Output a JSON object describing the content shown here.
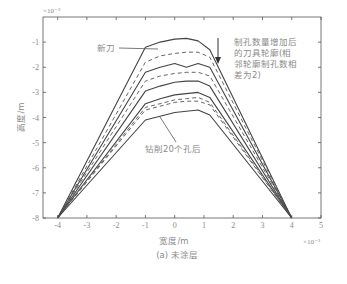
{
  "chart_data": {
    "type": "line",
    "title": "",
    "caption": "(a) 未涂层",
    "xlabel": "宽度/m",
    "ylabel": "高度/m",
    "x_exponent": "×10⁻³",
    "y_exponent": "×10⁻³",
    "xlim": [
      -4.5,
      5
    ],
    "ylim": [
      -8,
      0
    ],
    "xticks": [
      -4,
      -3,
      -2,
      -1,
      0,
      1,
      2,
      3,
      4,
      5
    ],
    "yticks": [
      -1,
      -2,
      -3,
      -4,
      -5,
      -6,
      -7,
      -8
    ],
    "xtick_labels": [
      "-4",
      "-3",
      "-2",
      "-1",
      "0",
      "1",
      "2",
      "3",
      "4",
      "5"
    ],
    "ytick_labels": [
      "-1",
      "-2",
      "-3",
      "-4",
      "-5",
      "-6",
      "-7",
      "-8"
    ],
    "grid": false,
    "annotations": {
      "new_tool": "新刀",
      "after_20": "钻削20个孔后",
      "arrow_note": [
        "制孔数量增加后",
        "的刀具轮廓(相",
        "邻轮廓制孔数相",
        "差为2)"
      ]
    },
    "series": [
      {
        "name": "新刀",
        "style": "solid",
        "x": [
          -4,
          -1.0,
          -0.5,
          0,
          0.4,
          0.8,
          1.2,
          4
        ],
        "y": [
          -8,
          -1.2,
          -1.0,
          -0.88,
          -0.85,
          -0.95,
          -1.3,
          -8
        ]
      },
      {
        "name": "2孔",
        "style": "dashed",
        "x": [
          -4,
          -1.0,
          -0.5,
          0,
          0.4,
          0.8,
          1.2,
          4
        ],
        "y": [
          -8,
          -1.8,
          -1.55,
          -1.45,
          -1.4,
          -1.4,
          -1.6,
          -8
        ]
      },
      {
        "name": "4孔",
        "style": "solid",
        "x": [
          -4,
          -1.0,
          -0.5,
          0,
          0.4,
          0.8,
          1.2,
          4
        ],
        "y": [
          -8,
          -2.2,
          -2.0,
          -1.85,
          -2.0,
          -1.85,
          -2.0,
          -8
        ]
      },
      {
        "name": "6孔",
        "style": "dashed",
        "x": [
          -4,
          -1.0,
          -0.5,
          0,
          0.4,
          0.8,
          1.2,
          4
        ],
        "y": [
          -8,
          -2.55,
          -2.35,
          -2.25,
          -2.2,
          -2.2,
          -2.35,
          -8
        ]
      },
      {
        "name": "8孔",
        "style": "solid",
        "x": [
          -4,
          -1.0,
          -0.5,
          0,
          0.4,
          0.8,
          1.2,
          4
        ],
        "y": [
          -8,
          -2.95,
          -2.75,
          -2.6,
          -2.55,
          -2.55,
          -2.75,
          -8
        ]
      },
      {
        "name": "10孔",
        "style": "solid",
        "x": [
          -4,
          -1.0,
          -0.5,
          0,
          0.4,
          0.8,
          1.2,
          4
        ],
        "y": [
          -8,
          -3.45,
          -3.25,
          -3.1,
          -3.05,
          -3.0,
          -3.2,
          -8
        ]
      },
      {
        "name": "12孔",
        "style": "dashed",
        "x": [
          -4,
          -1.0,
          -0.5,
          0,
          0.4,
          0.8,
          1.2,
          4
        ],
        "y": [
          -8,
          -3.6,
          -3.45,
          -3.3,
          -3.25,
          -3.2,
          -3.4,
          -8
        ]
      },
      {
        "name": "14孔",
        "style": "dashed",
        "x": [
          -4,
          -1.0,
          -0.5,
          0,
          0.4,
          0.8,
          1.2,
          4
        ],
        "y": [
          -8,
          -3.7,
          -3.55,
          -3.4,
          -3.35,
          -3.35,
          -3.5,
          -8
        ]
      },
      {
        "name": "钻削20个孔后",
        "style": "solid",
        "x": [
          -4,
          -1.0,
          -0.5,
          0,
          0.4,
          0.8,
          1.2,
          4
        ],
        "y": [
          -8,
          -4.1,
          -3.95,
          -3.8,
          -3.75,
          -3.7,
          -3.9,
          -8
        ]
      }
    ]
  }
}
